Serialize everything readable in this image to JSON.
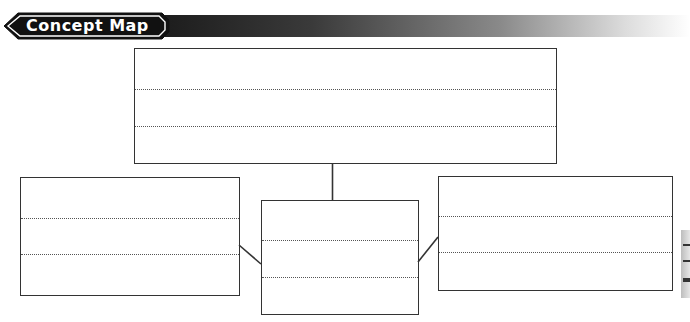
{
  "header": {
    "title": "Concept Map",
    "bar_gradient": [
      "#1a1a1a",
      "#8a8a8a",
      "#ffffff"
    ]
  },
  "concept_map": {
    "main_concept": {
      "lines": [
        "",
        "",
        ""
      ]
    },
    "sub_concepts": [
      {
        "position": "left",
        "lines": [
          "",
          "",
          ""
        ]
      },
      {
        "position": "center",
        "lines": [
          "",
          "",
          ""
        ]
      },
      {
        "position": "right",
        "lines": [
          "",
          "",
          ""
        ]
      }
    ]
  },
  "colors": {
    "border": "#333333",
    "rule": "#555555",
    "background": "#ffffff"
  }
}
